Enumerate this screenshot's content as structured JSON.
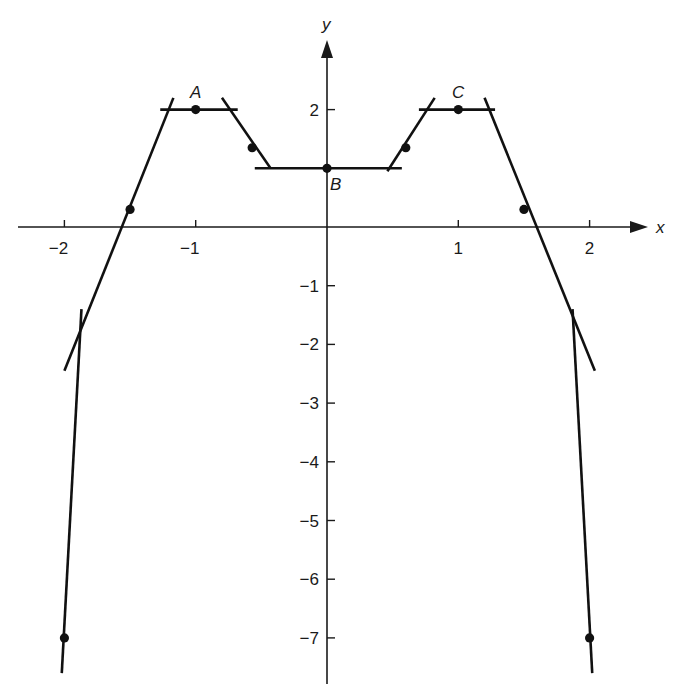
{
  "chart_data": {
    "type": "line",
    "title": "",
    "xlabel": "x",
    "ylabel": "y",
    "xlim": [
      -2.4,
      2.4
    ],
    "ylim": [
      -7.6,
      2.9
    ],
    "x_ticks": [
      -2,
      -1,
      1,
      2
    ],
    "x_tick_labels": [
      "-2",
      "-1",
      "1",
      "2"
    ],
    "y_ticks": [
      2,
      -1,
      -2,
      -3,
      -4,
      -5,
      -6,
      -7
    ],
    "y_tick_labels": [
      "2",
      "-1",
      "-2",
      "-3",
      "-4",
      "-5",
      "-6",
      "-7"
    ],
    "grid": false,
    "points": [
      {
        "x": -2.0,
        "y": -7.0,
        "label": ""
      },
      {
        "x": -1.5,
        "y": 0.3,
        "label": ""
      },
      {
        "x": -1.0,
        "y": 2.0,
        "label": "A"
      },
      {
        "x": -0.57,
        "y": 1.35,
        "label": ""
      },
      {
        "x": 0.0,
        "y": 1.0,
        "label": "B"
      },
      {
        "x": 0.6,
        "y": 1.35,
        "label": ""
      },
      {
        "x": 1.0,
        "y": 2.0,
        "label": "C"
      },
      {
        "x": 1.5,
        "y": 0.3,
        "label": ""
      },
      {
        "x": 2.0,
        "y": -7.0,
        "label": ""
      }
    ],
    "tangent_segments": [
      {
        "from": [
          -2.02,
          -7.6
        ],
        "to": [
          -1.87,
          -1.4
        ],
        "note": "steep tangent at x=-2"
      },
      {
        "from": [
          -2.0,
          -2.45
        ],
        "to": [
          -1.17,
          2.2
        ],
        "note": "tangent at x=-1.5"
      },
      {
        "from": [
          -1.27,
          2.0
        ],
        "to": [
          -0.68,
          2.0
        ],
        "note": "horizontal tangent at A"
      },
      {
        "from": [
          -0.8,
          2.2
        ],
        "to": [
          -0.43,
          1.0
        ],
        "note": "tangent at x=-0.57"
      },
      {
        "from": [
          -0.55,
          1.0
        ],
        "to": [
          0.57,
          1.0
        ],
        "note": "horizontal tangent at B"
      },
      {
        "from": [
          0.46,
          0.95
        ],
        "to": [
          0.82,
          2.2
        ],
        "note": "tangent at x=0.6"
      },
      {
        "from": [
          0.7,
          2.0
        ],
        "to": [
          1.28,
          2.0
        ],
        "note": "horizontal tangent at C"
      },
      {
        "from": [
          1.2,
          2.2
        ],
        "to": [
          2.04,
          -2.45
        ],
        "note": "tangent at x=1.5"
      },
      {
        "from": [
          1.87,
          -1.4
        ],
        "to": [
          2.02,
          -7.6
        ],
        "note": "steep tangent at x=2"
      }
    ]
  },
  "labels": {
    "x_axis": "x",
    "y_axis": "y",
    "point_a": "A",
    "point_b": "B",
    "point_c": "C"
  },
  "colors": {
    "ink": "#111111",
    "background": "#ffffff"
  }
}
